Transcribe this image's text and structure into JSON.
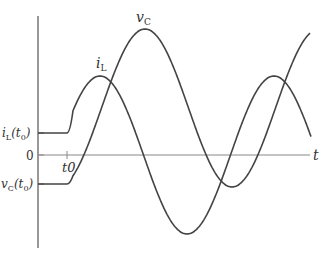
{
  "diagram": {
    "title": "",
    "axes": {
      "horizontal_label": "t",
      "zero_label": "0",
      "t0_tick_label": "t0",
      "colors": {
        "axis": "#555555",
        "curve": "#444444",
        "text": "#333333"
      }
    },
    "labels": {
      "iL_curve": {
        "main": "i",
        "sub": "L"
      },
      "vC_curve": {
        "main": "v",
        "sub": "C"
      },
      "iL_initial": {
        "main": "i",
        "sub": "L",
        "arg": "(t",
        "arg_sub": "0",
        "close": ")"
      },
      "vC_initial": {
        "main": "v",
        "sub": "C",
        "arg": "(t",
        "arg_sub": "0",
        "close": ")"
      }
    }
  },
  "chart_data": {
    "type": "line",
    "title": "",
    "xlabel": "t",
    "ylabel": "",
    "pixel_geometry": {
      "y_axis_x": 38,
      "y_axis_top": 16,
      "y_axis_bottom": 248,
      "x_axis_y": 155,
      "x_axis_end": 310,
      "t0_x": 67,
      "period_px": 174
    },
    "series": [
      {
        "name": "i_L",
        "initial_value_y": 133,
        "center_y": 155,
        "amplitude_px": 79,
        "peak_x": 100,
        "end_x": 311
      },
      {
        "name": "v_C",
        "initial_value_y": 184,
        "center_y": 108,
        "amplitude_px": 79,
        "peak_x": 145,
        "end_x": 310
      }
    ],
    "tick_labels": {
      "x": [
        "t0"
      ],
      "y": [
        "i_L(t0)",
        "0",
        "v_C(t0)"
      ]
    }
  }
}
